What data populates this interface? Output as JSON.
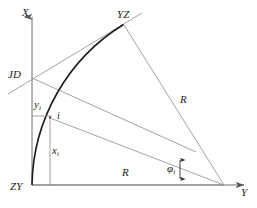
{
  "figure": {
    "type": "geometry-diagram",
    "background_color": "#ffffff",
    "line_color": "#6e6e6e",
    "curve_color": "#1c1c1c",
    "text_color": "#1a1a1a",
    "width": 257,
    "height": 208
  },
  "axes": {
    "x_axis_label": "X",
    "y_axis_label": "Y",
    "origin_label": "ZY"
  },
  "labels": {
    "x_axis": "X",
    "y_axis": "Y",
    "start_of_curve": "ZY",
    "end_of_curve": "YZ",
    "intersection_point": "JD",
    "curve_point": "i",
    "radius_right": "R",
    "radius_bottom": "R",
    "offset_y": "y",
    "offset_y_sub": "i",
    "offset_x": "x",
    "offset_x_sub": "i",
    "angle": "φ",
    "angle_sub": "i"
  },
  "geometry": {
    "origin": {
      "x": 32,
      "y": 185
    },
    "center": {
      "x": 224,
      "y": 185
    },
    "curve_end": {
      "x": 123,
      "y": 24
    },
    "jd_point": {
      "x": 32,
      "y": 78
    },
    "point_i": {
      "x": 50,
      "y": 118
    },
    "radius_px": 192,
    "y_axis_tip": {
      "x": 248,
      "y": 185
    },
    "x_axis_tip": {
      "x": 32,
      "y": 12
    }
  },
  "label_positions": {
    "x_axis": {
      "left": 22,
      "top": 7
    },
    "y_axis": {
      "left": 241,
      "top": 187
    },
    "start_of_curve": {
      "left": 12,
      "top": 182
    },
    "end_of_curve": {
      "left": 118,
      "top": 10
    },
    "intersection_point": {
      "left": 10,
      "top": 69
    },
    "curve_point": {
      "left": 57,
      "top": 112
    },
    "radius_right": {
      "left": 180,
      "top": 94
    },
    "radius_bottom": {
      "left": 122,
      "top": 168
    },
    "offset_y": {
      "left": 34,
      "top": 98
    },
    "offset_x": {
      "left": 52,
      "top": 145
    },
    "angle": {
      "left": 167,
      "top": 163
    }
  }
}
